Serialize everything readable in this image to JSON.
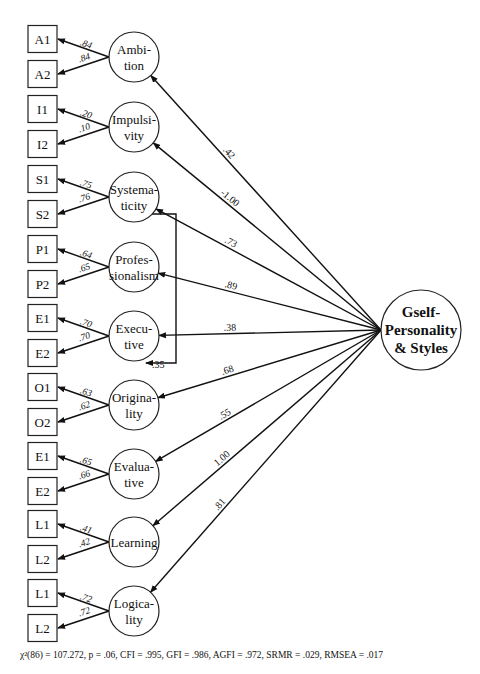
{
  "general_factor": {
    "label_lines": [
      "Gself-",
      "Personality",
      "& Styles"
    ],
    "cx": 421,
    "cy": 330,
    "r": 40
  },
  "factors": [
    {
      "name": "Ambition",
      "label_lines": [
        "Ambi-",
        "tion"
      ],
      "cy": 57,
      "indicators": [
        {
          "label": "A1",
          "loading": ".84"
        },
        {
          "label": "A2",
          "loading": ".84"
        }
      ],
      "g_loading": ".42"
    },
    {
      "name": "Impulsivity",
      "label_lines": [
        "Impulsi-",
        "vity"
      ],
      "cy": 127,
      "indicators": [
        {
          "label": "I1",
          "loading": ".20"
        },
        {
          "label": "I2",
          "loading": ".10"
        }
      ],
      "g_loading": "-1.00"
    },
    {
      "name": "Systematicity",
      "label_lines": [
        "Systema-",
        "ticity"
      ],
      "cy": 197,
      "indicators": [
        {
          "label": "S1",
          "loading": ".75"
        },
        {
          "label": "S2",
          "loading": ".76"
        }
      ],
      "g_loading": ".73"
    },
    {
      "name": "Professionalism",
      "label_lines": [
        "Profes-",
        "sionalism"
      ],
      "cy": 267,
      "indicators": [
        {
          "label": "P1",
          "loading": ".64"
        },
        {
          "label": "P2",
          "loading": ".65"
        }
      ],
      "g_loading": ".89"
    },
    {
      "name": "Executive",
      "label_lines": [
        "Execu-",
        "tive"
      ],
      "cy": 336,
      "indicators": [
        {
          "label": "E1",
          "loading": ".70"
        },
        {
          "label": "E2",
          "loading": ".70"
        }
      ],
      "g_loading": ".38"
    },
    {
      "name": "Originality",
      "label_lines": [
        "Origina-",
        "lity"
      ],
      "cy": 405,
      "indicators": [
        {
          "label": "O1",
          "loading": ".63"
        },
        {
          "label": "O2",
          "loading": ".62"
        }
      ],
      "g_loading": ".68"
    },
    {
      "name": "Evaluative",
      "label_lines": [
        "Evalua-",
        "tive"
      ],
      "cy": 474,
      "indicators": [
        {
          "label": "E1",
          "loading": ".65"
        },
        {
          "label": "E2",
          "loading": ".66"
        }
      ],
      "g_loading": ".55"
    },
    {
      "name": "Learning",
      "label_lines": [
        "Learning"
      ],
      "cy": 542,
      "indicators": [
        {
          "label": "L1",
          "loading": ".41"
        },
        {
          "label": "L2",
          "loading": ".42"
        }
      ],
      "g_loading": "1.00"
    },
    {
      "name": "Logicality",
      "label_lines": [
        "Logica-",
        "lity"
      ],
      "cy": 611,
      "indicators": [
        {
          "label": "L1",
          "loading": ".72"
        },
        {
          "label": "L2",
          "loading": ".72"
        }
      ],
      "g_loading": ".81"
    }
  ],
  "correlated_residual": {
    "from": "Systematicity",
    "to": "Executive",
    "value": ".35"
  },
  "fit_statistics": "χ²(86) = 107.272, p = .06, CFI = .995, GFI = .986, AGFI = .972, SRMR = .029, RMSEA = .017"
}
